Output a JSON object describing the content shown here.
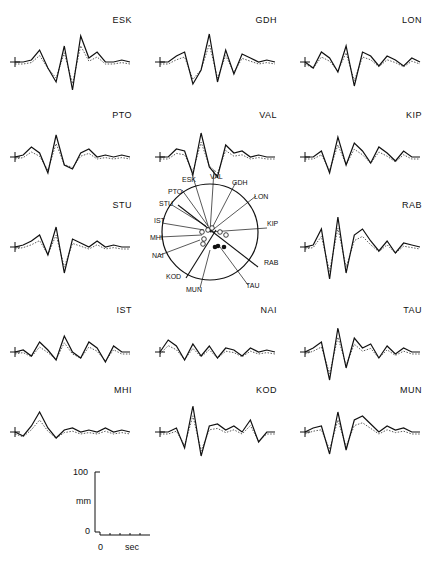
{
  "chart_data": {
    "type": "line",
    "title": "",
    "stations": [
      {
        "code": "ESK",
        "row": 0,
        "col": 0,
        "values": [
          0,
          0,
          0.1,
          0.6,
          -0.3,
          -1.0,
          0.8,
          -1.4,
          1.3,
          0.2,
          0.5,
          0,
          0,
          0.1,
          0
        ]
      },
      {
        "code": "GDH",
        "row": 0,
        "col": 1,
        "values": [
          0,
          0,
          0.3,
          0.5,
          -1.1,
          -0.4,
          1.4,
          -1.0,
          0.6,
          -0.6,
          0.4,
          0.2,
          0,
          0.1,
          0
        ]
      },
      {
        "code": "LON",
        "row": 0,
        "col": 2,
        "values": [
          0,
          -0.3,
          0.5,
          0.2,
          -0.5,
          0.8,
          -1.2,
          0.5,
          0.3,
          -0.2,
          0.3,
          0.1,
          -0.2,
          0.2,
          0
        ]
      },
      {
        "code": "PTO",
        "row": 1,
        "col": 0,
        "values": [
          0,
          0.1,
          0.5,
          0.2,
          -0.8,
          1.1,
          -0.4,
          -0.6,
          0.2,
          0.4,
          0,
          0.1,
          0,
          0.1,
          0
        ]
      },
      {
        "code": "VAL",
        "row": 1,
        "col": 1,
        "values": [
          0,
          0,
          0.4,
          0.3,
          -0.9,
          1.2,
          -0.5,
          -1.0,
          0.6,
          0.2,
          0.3,
          0,
          0.1,
          0,
          0
        ]
      },
      {
        "code": "KIP",
        "row": 1,
        "col": 2,
        "values": [
          0,
          0,
          0.3,
          -0.8,
          1.0,
          -0.4,
          0.7,
          0.3,
          -0.3,
          0.5,
          0.2,
          -0.2,
          0.3,
          0,
          0
        ]
      },
      {
        "code": "STU",
        "row": 2,
        "col": 0,
        "values": [
          0,
          0.1,
          0.3,
          0.6,
          -0.4,
          1.0,
          -1.3,
          0.4,
          0.2,
          0,
          0.3,
          0,
          0.1,
          0,
          0
        ]
      },
      {
        "code": "RAB",
        "row": 2,
        "col": 2,
        "values": [
          0,
          0.1,
          0.9,
          -1.6,
          1.5,
          -1.3,
          0.6,
          0.9,
          0.3,
          -0.2,
          0.3,
          -0.3,
          0.2,
          0.1,
          0
        ]
      },
      {
        "code": "IST",
        "row": 3,
        "col": 0,
        "values": [
          0,
          0.1,
          -0.2,
          0.5,
          0.1,
          -0.4,
          0.8,
          0,
          -0.3,
          0.5,
          0.2,
          -0.5,
          0.3,
          0,
          0
        ]
      },
      {
        "code": "NAI",
        "row": 3,
        "col": 1,
        "values": [
          0,
          0.6,
          0.3,
          -0.4,
          0.4,
          -0.2,
          0.3,
          -0.3,
          0.2,
          0.1,
          -0.2,
          0.2,
          0,
          0.1,
          0
        ]
      },
      {
        "code": "TAU",
        "row": 3,
        "col": 2,
        "values": [
          0,
          0.2,
          0.5,
          -1.4,
          1.2,
          -0.8,
          0.7,
          0.2,
          0.4,
          -0.3,
          0.3,
          -0.1,
          0.2,
          0,
          0
        ]
      },
      {
        "code": "MHI",
        "row": 4,
        "col": 0,
        "values": [
          0,
          -0.2,
          0.3,
          1.0,
          0.2,
          -0.3,
          0.1,
          0.2,
          0,
          0.1,
          0,
          0.2,
          0,
          0.1,
          0
        ]
      },
      {
        "code": "KOD",
        "row": 4,
        "col": 1,
        "values": [
          0,
          0,
          0.2,
          -0.8,
          1.3,
          -1.2,
          0.3,
          0.4,
          0.1,
          0.3,
          0,
          0.6,
          -0.5,
          0,
          0
        ]
      },
      {
        "code": "MUN",
        "row": 4,
        "col": 2,
        "values": [
          0,
          0.2,
          0.3,
          -1.1,
          1.0,
          -0.9,
          0.6,
          0.8,
          0.4,
          0,
          0.3,
          0.1,
          0.2,
          0,
          0
        ]
      }
    ],
    "series": [
      {
        "name": "observed",
        "style": "solid"
      },
      {
        "name": "synthetic",
        "style": "dotted"
      }
    ],
    "scale_bar": {
      "ylabel": "mm",
      "ymin": "0",
      "ymax": "100",
      "xlabel": "sec",
      "xmin": "0",
      "xmax": "60"
    },
    "focal_sphere_labels": [
      "ESK",
      "VAL",
      "GDH",
      "LON",
      "KIP",
      "RAB",
      "TAU",
      "MUN",
      "KOD",
      "NAI",
      "MHI",
      "IST",
      "STU",
      "PTO"
    ]
  }
}
